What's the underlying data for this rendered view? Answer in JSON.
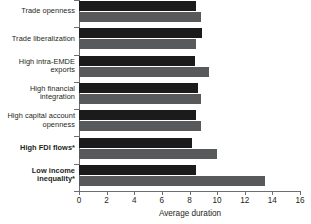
{
  "chart_data": {
    "type": "bar",
    "orientation": "horizontal",
    "title": "",
    "xlabel": "Average duration",
    "ylabel": "",
    "xlim": [
      0,
      16
    ],
    "xticks": [
      0,
      2,
      4,
      6,
      8,
      10,
      12,
      14,
      16
    ],
    "xticklabels": [
      "0",
      "2",
      "4",
      "6",
      "8",
      "10",
      "12",
      "14",
      "16"
    ],
    "grid": false,
    "legend": null,
    "categories": [
      "Trade openness",
      "Trade liberalization",
      "High intra-EMDE exports",
      "High financial integration",
      "High capital account openness",
      "High FDI flows*",
      "Low income inequality*"
    ],
    "category_lines": [
      [
        "Trade openness"
      ],
      [
        "Trade liberalization"
      ],
      [
        "High intra-EMDE",
        "exports"
      ],
      [
        "High financial",
        "integration"
      ],
      [
        "High capital account",
        "openness"
      ],
      [
        "High FDI flows*"
      ],
      [
        "Low income",
        "inequality*"
      ]
    ],
    "category_emphasis": [
      false,
      false,
      false,
      false,
      false,
      true,
      true
    ],
    "series": [
      {
        "name": "series-1",
        "color": "#1b1b1b",
        "values": [
          8.5,
          8.9,
          8.4,
          8.6,
          8.5,
          8.2,
          8.5
        ]
      },
      {
        "name": "series-2",
        "color": "#58595b",
        "values": [
          8.8,
          8.5,
          9.4,
          8.8,
          8.8,
          10.0,
          13.5
        ]
      }
    ],
    "footnote": "* denotes bold category"
  },
  "axis": {
    "x_title": "Average duration"
  }
}
